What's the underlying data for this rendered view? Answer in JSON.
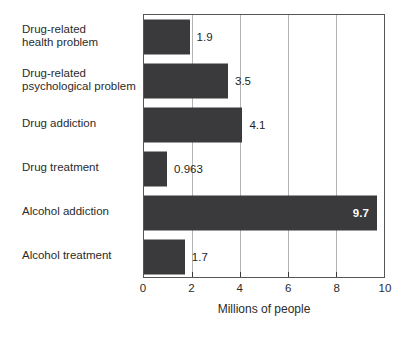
{
  "chart_data": {
    "type": "bar",
    "orientation": "horizontal",
    "title": "",
    "xlabel": "Millions of people",
    "ylabel": "",
    "xlim": [
      0,
      10
    ],
    "x_ticks": [
      0,
      2,
      4,
      6,
      8,
      10
    ],
    "x_tick_labels": [
      "0",
      "2",
      "4",
      "6",
      "8",
      "10"
    ],
    "grid": "vertical gridlines at interior ticks",
    "legend": "none",
    "categories": [
      "Drug-related health problem",
      "Drug-related psychological problem",
      "Drug addiction",
      "Drug treatment",
      "Alcohol addiction",
      "Alcohol treatment"
    ],
    "category_label_lines": [
      [
        "Drug-related",
        "health problem"
      ],
      [
        "Drug-related",
        "psychological problem"
      ],
      [
        "Drug addiction"
      ],
      [
        "Drug treatment"
      ],
      [
        "Alcohol addiction"
      ],
      [
        "Alcohol treatment"
      ]
    ],
    "values": [
      1.9,
      3.5,
      4.1,
      0.963,
      9.7,
      1.7
    ],
    "value_labels": [
      "1.9",
      "3.5",
      "4.1",
      "0.963",
      "9.7",
      "1.7"
    ],
    "value_label_placement": [
      "outside",
      "outside",
      "outside",
      "outside",
      "inside",
      "outside"
    ],
    "colors": {
      "bar": "#3a3a3c",
      "gridline": "#b4b4b4",
      "plot_border": "#555555",
      "tick": "#3a3a3c",
      "text": "#2b2b2b",
      "value_label_outside": "#1f1f1f",
      "value_label_inside": "#ffffff",
      "background": "#ffffff"
    }
  }
}
